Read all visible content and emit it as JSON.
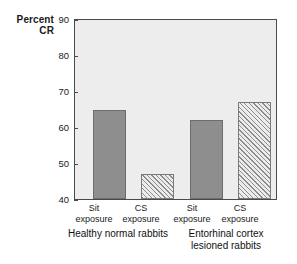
{
  "chart_data": {
    "type": "bar",
    "title": "",
    "xlabel": "",
    "ylabel": "Percent\nCR",
    "ylim": [
      40,
      90
    ],
    "yticks": [
      90,
      80,
      70,
      60,
      50,
      40
    ],
    "grid": false,
    "legend": null,
    "categories": [
      "Sit\nexposure",
      "CS\nexposure",
      "Sit\nexposure",
      "CS\nexposure"
    ],
    "values": [
      65,
      47,
      62,
      67
    ],
    "bar_styles": [
      "solid",
      "hatched",
      "solid",
      "hatched"
    ],
    "groups": [
      {
        "label": "Healthy normal rabbits",
        "categories": [
          "Sit\nexposure",
          "CS\nexposure"
        ],
        "values": [
          65,
          47
        ]
      },
      {
        "label": "Entorhinal cortex\nlesioned rabbits",
        "categories": [
          "Sit\nexposure",
          "CS\nexposure"
        ],
        "values": [
          62,
          67
        ]
      }
    ],
    "colors": {
      "solid_bar": "#8e8e8e",
      "hatched_bar": "#e6e6e6",
      "hatch_line": "#8d8d8d",
      "plot_background": "#ededed",
      "axis": "#4a4a4a",
      "page_background": "#ffffff",
      "text": "#1a1a1a"
    }
  },
  "axis": {
    "y_title": "Percent\nCR",
    "ticks": {
      "t90": "90",
      "t80": "80",
      "t70": "70",
      "t60": "60",
      "t50": "50",
      "t40": "40"
    }
  },
  "xlabels": {
    "b1": "Sit\nexposure",
    "b2": "CS\nexposure",
    "b3": "Sit\nexposure",
    "b4": "CS\nexposure"
  },
  "groups": {
    "g1": "Healthy normal rabbits",
    "g2": "Entorhinal cortex\nlesioned rabbits"
  }
}
